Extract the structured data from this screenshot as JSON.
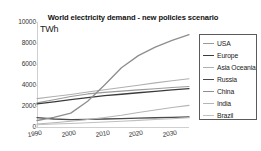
{
  "chart_data": {
    "type": "line",
    "title": "World electricity demand - new policies scenario",
    "subtitle": "",
    "xlabel": "",
    "ylabel": "TWh",
    "unit_label": "TWh",
    "xlim": [
      1990,
      2035
    ],
    "ylim": [
      0,
      10000
    ],
    "grid": false,
    "legend_position": "right",
    "xticks": [
      "1990",
      "2000",
      "2010",
      "2020",
      "2030"
    ],
    "xtick_values": [
      1990,
      2000,
      2010,
      2020,
      2030
    ],
    "yticks": [
      "0",
      "2000",
      "4000",
      "6000",
      "8000",
      "10000"
    ],
    "ytick_values": [
      0,
      2000,
      4000,
      6000,
      8000,
      10000
    ],
    "x": [
      1990,
      1995,
      2000,
      2005,
      2010,
      2015,
      2020,
      2025,
      2030,
      2035
    ],
    "series": [
      {
        "name": "USA",
        "color": "#9a9a9a",
        "width": 1.1,
        "values": [
          2300,
          2600,
          2900,
          3150,
          3300,
          3420,
          3540,
          3650,
          3760,
          3860
        ]
      },
      {
        "name": "Europe",
        "color": "#3b3b3b",
        "width": 1.3,
        "values": [
          2200,
          2400,
          2600,
          2800,
          2980,
          3120,
          3260,
          3400,
          3530,
          3650
        ]
      },
      {
        "name": "Asia Oceania",
        "color": "#b0b0b0",
        "width": 1.1,
        "values": [
          2700,
          2900,
          3100,
          3330,
          3550,
          3760,
          3980,
          4200,
          4400,
          4600
        ]
      },
      {
        "name": "Russia",
        "color": "#4a4a4a",
        "width": 1.3,
        "values": [
          900,
          760,
          700,
          720,
          760,
          800,
          840,
          880,
          920,
          960
        ]
      },
      {
        "name": "China",
        "color": "#8e8e8e",
        "width": 1.3,
        "values": [
          620,
          920,
          1320,
          2450,
          4000,
          5650,
          6800,
          7600,
          8250,
          8800
        ]
      },
      {
        "name": "India",
        "color": "#b5b5b5",
        "width": 1.1,
        "values": [
          280,
          400,
          550,
          720,
          900,
          1120,
          1380,
          1620,
          1850,
          2060
        ]
      },
      {
        "name": "Brazil",
        "color": "#c0c0c0",
        "width": 1.1,
        "values": [
          220,
          280,
          340,
          400,
          470,
          550,
          630,
          710,
          790,
          880
        ]
      }
    ]
  },
  "legend": {
    "entries": [
      {
        "label": "USA"
      },
      {
        "label": "Europe"
      },
      {
        "label": "Asia Oceania"
      },
      {
        "label": "Russia"
      },
      {
        "label": "China"
      },
      {
        "label": "India"
      },
      {
        "label": "Brazil"
      }
    ]
  }
}
